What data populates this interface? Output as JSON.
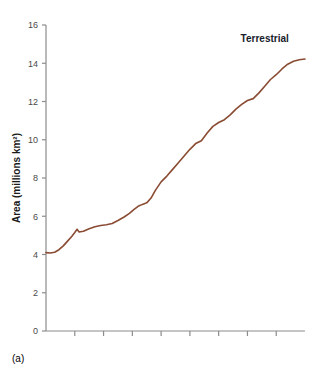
{
  "figure": {
    "panel_caption": "(a)",
    "background_color": "#ffffff"
  },
  "chart_data": {
    "type": "line",
    "title": "",
    "subtitle": "",
    "xlabel": "",
    "ylabel": "Area (millions km²)",
    "grid": false,
    "legend_position": "inline-end-of-line",
    "line_color": "#8a4b33",
    "axis_color": "#8c8c8c",
    "xlim": [
      0,
      9
    ],
    "ylim": [
      0,
      16
    ],
    "ytick_values": [
      0,
      2,
      4,
      6,
      8,
      10,
      12,
      14,
      16
    ],
    "ytick_labels": [
      "0",
      "2",
      "4",
      "6",
      "8",
      "10",
      "12",
      "14",
      "16"
    ],
    "xtick_values": [
      0,
      1,
      2,
      3,
      4,
      5,
      6,
      7,
      8,
      9
    ],
    "xtick_labels": [
      "",
      "",
      "",
      "",
      "",
      "",
      "",
      "",
      "",
      ""
    ],
    "series": [
      {
        "name": "Terrestrial",
        "label": "Terrestrial",
        "label_x": 7.6,
        "label_y": 15.1,
        "x": [
          0.0,
          0.15,
          0.3,
          0.45,
          0.6,
          0.75,
          0.9,
          1.0,
          1.08,
          1.15,
          1.3,
          1.5,
          1.7,
          1.9,
          2.1,
          2.3,
          2.5,
          2.7,
          2.9,
          3.05,
          3.2,
          3.35,
          3.5,
          3.65,
          3.8,
          4.0,
          4.2,
          4.4,
          4.6,
          4.8,
          5.0,
          5.2,
          5.4,
          5.6,
          5.8,
          6.0,
          6.2,
          6.4,
          6.6,
          6.8,
          7.0,
          7.2,
          7.4,
          7.6,
          7.8,
          8.0,
          8.2,
          8.4,
          8.6,
          8.8,
          9.0
        ],
        "y": [
          4.1,
          4.08,
          4.12,
          4.25,
          4.45,
          4.7,
          4.95,
          5.15,
          5.32,
          5.18,
          5.22,
          5.35,
          5.45,
          5.52,
          5.56,
          5.62,
          5.78,
          5.95,
          6.15,
          6.35,
          6.52,
          6.62,
          6.7,
          6.95,
          7.35,
          7.8,
          8.1,
          8.45,
          8.8,
          9.15,
          9.5,
          9.8,
          9.95,
          10.35,
          10.7,
          10.9,
          11.05,
          11.3,
          11.6,
          11.85,
          12.05,
          12.15,
          12.45,
          12.8,
          13.15,
          13.4,
          13.7,
          13.95,
          14.1,
          14.18,
          14.22
        ],
        "start_value": 4.1,
        "end_value": 14.2
      }
    ]
  }
}
